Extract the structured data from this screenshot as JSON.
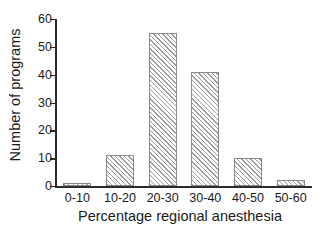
{
  "chart_data": {
    "type": "bar",
    "title": "",
    "xlabel": "Percentage regional anesthesia",
    "ylabel": "Number of programs",
    "categories": [
      "0-10",
      "10-20",
      "20-30",
      "30-40",
      "40-50",
      "50-60"
    ],
    "values": [
      1,
      11,
      55,
      41,
      10,
      2
    ],
    "ylim": [
      0,
      60
    ],
    "yticks": [
      0,
      10,
      20,
      30,
      40,
      50,
      60
    ],
    "ytick_labels": [
      "0",
      "10",
      "20",
      "30",
      "40",
      "50",
      "60"
    ],
    "grid": false,
    "legend": null,
    "legend_position": "none",
    "series": [
      {
        "name": "Number of programs",
        "values": [
          1,
          11,
          55,
          41,
          10,
          2
        ]
      }
    ],
    "style": {
      "bar_fill": "#ffffff",
      "bar_hatch": "diagonal-45",
      "bar_hatch_color": "#9a9a9a",
      "bar_edge": "#8a8a8a",
      "axis_color": "#2b2b2b",
      "text_color": "#1a1a1a",
      "background": "#ffffff"
    }
  }
}
